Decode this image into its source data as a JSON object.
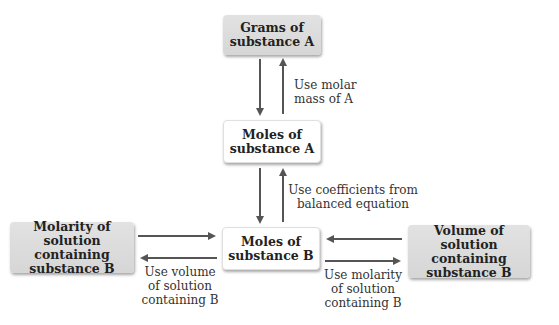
{
  "diagram": {
    "nodes": {
      "grams_a": "Grams of\nsubstance A",
      "moles_a": "Moles of\nsubstance A",
      "moles_b": "Moles of\nsubstance B",
      "molarity_b": "Molarity of\nsolution containing\nsubstance B",
      "volume_b": "Volume of\nsolution containing\nsubstance B"
    },
    "edge_labels": {
      "molar_mass": "Use molar\nmass of A",
      "coefficients": "Use coefficients from\nbalanced equation",
      "use_volume": "Use volume\nof solution\ncontaining B",
      "use_molarity": "Use molarity\nof solution\ncontaining B"
    },
    "colors": {
      "gray_box": "#d9d9d9",
      "white_box": "#ffffff",
      "arrow": "#555555"
    }
  }
}
